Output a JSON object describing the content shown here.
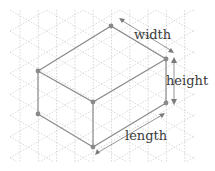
{
  "diagram": {
    "type": "isometric-box",
    "labels": {
      "width": "width",
      "height": "height",
      "length": "length"
    },
    "colors": {
      "edge": "#8a8a8a",
      "grid": "#c9c9c9",
      "text": "#3a3a3a"
    }
  }
}
